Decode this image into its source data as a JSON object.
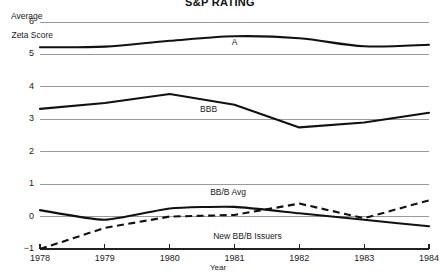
{
  "chart_data": {
    "type": "line",
    "title": "S&P RATING",
    "xlabel": "Year",
    "ylabel": "Average\nZeta Score",
    "ylabel_line1": "Average",
    "ylabel_line2": "Zeta Score",
    "x": [
      1978,
      1979,
      1980,
      1981,
      1982,
      1983,
      1984
    ],
    "xlim": [
      1978,
      1984
    ],
    "ylim": [
      -1,
      6
    ],
    "yticks": [
      6,
      5,
      4,
      3,
      2,
      1,
      0,
      -1
    ],
    "ytick_labels": [
      "6",
      "5",
      "4",
      "3",
      "2",
      "1",
      "0",
      "−1"
    ],
    "xticks": [
      1978,
      1979,
      1980,
      1981,
      1982,
      1983,
      1984
    ],
    "xtick_labels": [
      "1978",
      "1979",
      "1980",
      "1981",
      "1982",
      "1983",
      "1984"
    ],
    "grid": "horizontal",
    "legend": "inline-annotations",
    "line_color": "#111111",
    "grid_color": "#9a9a9a",
    "background": "#ffffff",
    "series": [
      {
        "name": "A",
        "label": "A",
        "style": "solid",
        "values": [
          5.22,
          5.24,
          5.42,
          5.56,
          5.5,
          5.25,
          5.3
        ]
      },
      {
        "name": "BBB",
        "label": "BBB",
        "style": "solid",
        "values": [
          3.32,
          3.5,
          3.78,
          3.45,
          2.75,
          2.9,
          3.2
        ]
      },
      {
        "name": "BB/B Avg",
        "label": "BB/B Avg",
        "style": "solid",
        "values": [
          0.2,
          -0.1,
          0.25,
          0.3,
          0.1,
          -0.1,
          -0.3
        ]
      },
      {
        "name": "New BB/B Issuers",
        "label": "New BB/B Issuers",
        "style": "dashed",
        "values": [
          -1.0,
          -0.35,
          0.0,
          0.05,
          0.4,
          -0.05,
          0.5
        ]
      }
    ],
    "annotations": [
      {
        "text": "A",
        "x": 1981.0,
        "y": 5.35
      },
      {
        "text": "BBB",
        "x": 1980.6,
        "y": 3.3
      },
      {
        "text": "BB/B Avg",
        "x": 1980.9,
        "y": 0.72
      },
      {
        "text": "New BB/B Issuers",
        "x": 1981.2,
        "y": -0.62
      }
    ]
  }
}
